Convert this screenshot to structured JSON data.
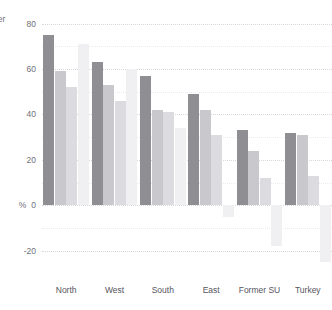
{
  "chart_data": {
    "type": "bar",
    "title": "",
    "cropped_top_label": "",
    "xlabel": "",
    "ylabel": "% change per worker",
    "ylabel_visible_text": "orker",
    "yunit": "%",
    "ylim": [
      -28,
      82
    ],
    "yticks": [
      -20,
      0,
      20,
      40,
      60,
      80
    ],
    "ytick_labels": [
      "-20",
      "0",
      "20",
      "40",
      "60",
      "80"
    ],
    "grid": true,
    "legend": "none",
    "categories": [
      "North",
      "West",
      "South",
      "East",
      "Former SU",
      "Turkey"
    ],
    "series": [
      {
        "name": "series-1",
        "color": "#8e8e93",
        "values": [
          75,
          63,
          57,
          49,
          33,
          32
        ]
      },
      {
        "name": "series-2",
        "color": "#c9c9cd",
        "values": [
          59,
          53,
          42,
          42,
          24,
          31
        ]
      },
      {
        "name": "series-3",
        "color": "#dcdce0",
        "values": [
          52,
          46,
          41,
          31,
          12,
          13
        ]
      },
      {
        "name": "series-4",
        "color": "#f0f0f2",
        "values": [
          71,
          60,
          34,
          -5,
          -18,
          -25
        ]
      }
    ]
  },
  "axis": {
    "y_unit_symbol": "%",
    "y_title": "orker"
  }
}
